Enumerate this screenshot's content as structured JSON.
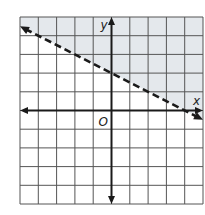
{
  "chart_data": {
    "type": "line",
    "title": "",
    "xlabel": "x",
    "ylabel": "y",
    "origin_label": "O",
    "xlim": [
      -5,
      5
    ],
    "ylim": [
      -5,
      5
    ],
    "grid": true,
    "grid_step": 1,
    "inequality": "y > -1/2 x + 2",
    "boundary": {
      "slope": -0.5,
      "intercept": 2,
      "style": "dashed",
      "points": [
        [
          -5,
          4.5
        ],
        [
          0,
          2
        ],
        [
          5,
          -0.5
        ]
      ]
    },
    "shaded_region": "above boundary line",
    "colors": {
      "shade": "#e4e8ec",
      "grid": "#555555",
      "axis": "#1a1a1a",
      "boundary": "#1a1a1a"
    }
  }
}
